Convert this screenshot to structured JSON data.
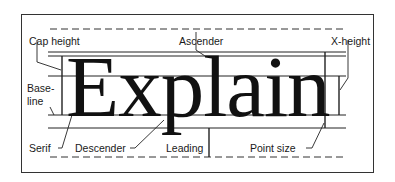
{
  "diagram": {
    "sample_word": "Explain",
    "labels": {
      "cap_height": "Cap height",
      "ascender": "Ascender",
      "x_height": "X-height",
      "baseline_1": "Base-",
      "baseline_2": "line",
      "serif": "Serif",
      "descender": "Descender",
      "leading": "Leading",
      "point_size": "Point size"
    },
    "colors": {
      "ink": "#1a1a1a",
      "background": "#ffffff"
    }
  }
}
